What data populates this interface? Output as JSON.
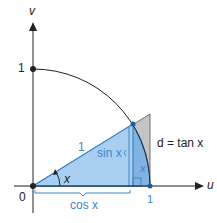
{
  "diagram": {
    "axes": {
      "x_label": "u",
      "y_label": "v",
      "origin_label": "0",
      "x_tick_label": "1",
      "y_tick_label": "1"
    },
    "labels": {
      "hypotenuse": "1",
      "angle": "x",
      "opposite": "sin x",
      "adjacent": "cos x",
      "arc": "x",
      "tangent": "d = tan x"
    },
    "colors": {
      "triangle_fill": "#a9cff0",
      "sector_fill": "#7fb3e3",
      "tan_fill": "#bdbdbd",
      "outline": "#3d86c6",
      "axis": "#222222",
      "blue_text": "#3d86c6"
    }
  }
}
